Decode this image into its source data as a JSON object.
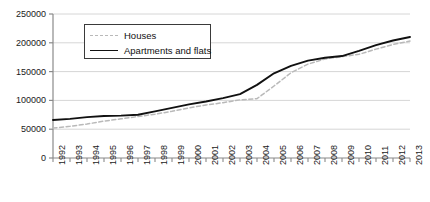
{
  "chart_data": {
    "type": "line",
    "title": "",
    "xlabel": "",
    "ylabel": "",
    "ylim": [
      0,
      250000
    ],
    "ytick_labels": [
      "0",
      "50000",
      "100000",
      "150000",
      "200000",
      "250000"
    ],
    "ytick_values": [
      0,
      50000,
      100000,
      150000,
      200000,
      250000
    ],
    "grid": true,
    "legend_position": "upper-left-inside",
    "categories": [
      "1992",
      "1993",
      "1994",
      "1995",
      "1996",
      "1997",
      "1998",
      "1999",
      "2000",
      "2001",
      "2002",
      "2003",
      "2004",
      "2005",
      "2006",
      "2007",
      "2008",
      "2009",
      "2010",
      "2011",
      "2012",
      "2013"
    ],
    "series": [
      {
        "name": "Houses",
        "style": "dashed",
        "color": "#b9b9b9",
        "values": [
          52000,
          55000,
          59000,
          64000,
          68000,
          72000,
          76000,
          81000,
          87000,
          92000,
          96000,
          101000,
          103000,
          125000,
          148000,
          163000,
          172000,
          176000,
          180000,
          189000,
          197000,
          203000
        ]
      },
      {
        "name": "Apartments and flats",
        "style": "solid",
        "color": "#111111",
        "values": [
          66000,
          68000,
          71000,
          73000,
          73500,
          75000,
          81000,
          87000,
          93000,
          98000,
          104000,
          111000,
          127000,
          147000,
          160000,
          169000,
          174000,
          177000,
          186000,
          196000,
          204000,
          210000
        ]
      }
    ]
  },
  "legend": {
    "items": [
      {
        "label": "Houses"
      },
      {
        "label": "Apartments and flats"
      }
    ]
  },
  "colors": {
    "axis": "#8a8a8a",
    "grid": "#d6d6d6",
    "houses": "#b9b9b9",
    "apartments": "#111111",
    "text": "#1a1a1a",
    "background": "#ffffff"
  }
}
